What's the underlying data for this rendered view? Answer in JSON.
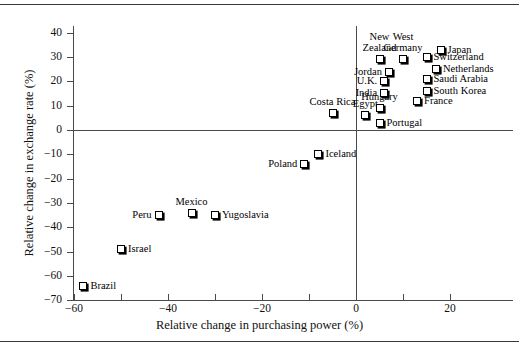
{
  "chart_data": {
    "type": "scatter",
    "title": "",
    "xlabel": "Relative change in purchasing power (%)",
    "ylabel": "Relative change in exchange rate (%)",
    "xlim": [
      -62,
      31
    ],
    "ylim": [
      -70,
      45
    ],
    "xticks": [
      -60,
      -50,
      -40,
      -30,
      -20,
      -10,
      0,
      10,
      20
    ],
    "xticklabels": [
      "-60",
      "",
      "-40",
      "",
      "-20",
      "",
      "0",
      "",
      "20"
    ],
    "yticks": [
      -70,
      -60,
      -50,
      -40,
      -30,
      -20,
      -10,
      0,
      10,
      20,
      30,
      40
    ],
    "yticklabels": [
      "-70",
      "-60",
      "-50",
      "-40",
      "-30",
      "-20",
      "-10",
      "0",
      "10",
      "20",
      "30",
      "40"
    ],
    "grid": false,
    "legend": "none",
    "reference_lines": [
      {
        "axis": "y",
        "value": 0
      },
      {
        "axis": "x",
        "value": 0
      }
    ],
    "points": [
      {
        "label": "Brazil",
        "x": -58,
        "y": -64,
        "label_pos": "right"
      },
      {
        "label": "Israel",
        "x": -50,
        "y": -49,
        "label_pos": "right"
      },
      {
        "label": "Peru",
        "x": -42,
        "y": -35,
        "label_pos": "left"
      },
      {
        "label": "Mexico",
        "x": -35,
        "y": -34,
        "label_pos": "above"
      },
      {
        "label": "Yugoslavia",
        "x": -30,
        "y": -35,
        "label_pos": "right"
      },
      {
        "label": "Poland",
        "x": -11,
        "y": -14,
        "label_pos": "left"
      },
      {
        "label": "Iceland",
        "x": -8,
        "y": -10,
        "label_pos": "right"
      },
      {
        "label": "Costa Rica",
        "x": -5,
        "y": 7,
        "label_pos": "above"
      },
      {
        "label": "Egypt",
        "x": 2,
        "y": 6,
        "label_pos": "above"
      },
      {
        "label": "Portugal",
        "x": 5,
        "y": 3,
        "label_pos": "right"
      },
      {
        "label": "Hungary",
        "x": 5,
        "y": 9,
        "label_pos": "above"
      },
      {
        "label": "India",
        "x": 6,
        "y": 15,
        "label_pos": "left"
      },
      {
        "label": "U.K.",
        "x": 6,
        "y": 20,
        "label_pos": "left"
      },
      {
        "label": "Jordan",
        "x": 7,
        "y": 24,
        "label_pos": "left"
      },
      {
        "label": "New Zealand",
        "x": 5,
        "y": 29,
        "label_pos": "above2"
      },
      {
        "label": "West Germany",
        "x": 10,
        "y": 29,
        "label_pos": "above2"
      },
      {
        "label": "France",
        "x": 13,
        "y": 12,
        "label_pos": "right"
      },
      {
        "label": "South Korea",
        "x": 15,
        "y": 16,
        "label_pos": "right"
      },
      {
        "label": "Saudi Arabia",
        "x": 15,
        "y": 21,
        "label_pos": "right"
      },
      {
        "label": "Netherlands",
        "x": 17,
        "y": 25,
        "label_pos": "right"
      },
      {
        "label": "Switzerland",
        "x": 15,
        "y": 30,
        "label_pos": "right"
      },
      {
        "label": "Japan",
        "x": 18,
        "y": 33,
        "label_pos": "right"
      }
    ],
    "marker_style": {
      "shape": "square",
      "fill": "#ffffff",
      "edge": "#000000",
      "shadow": "#000000"
    }
  }
}
